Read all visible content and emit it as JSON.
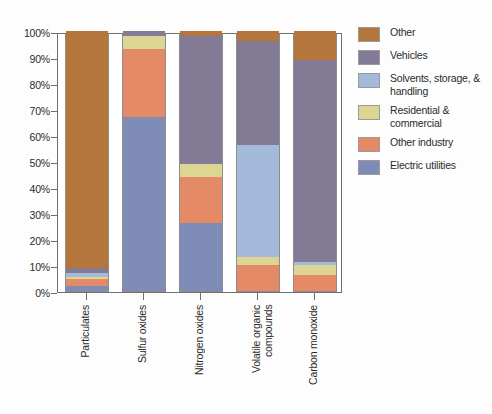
{
  "chart_data": {
    "type": "bar",
    "subtype": "stacked-percentage-column",
    "title": "",
    "subtitle": "",
    "xlabel": "",
    "ylabel": "",
    "ylim": [
      0,
      100
    ],
    "y_tick_labels": [
      "100%",
      "90%",
      "80%",
      "70%",
      "60%",
      "50%",
      "40%",
      "30%",
      "20%",
      "10%",
      "0%"
    ],
    "y_tick_values": [
      100,
      90,
      80,
      70,
      60,
      50,
      40,
      30,
      20,
      10,
      0
    ],
    "grid": false,
    "legend_position": "right",
    "categories": [
      "Particulates",
      "Sulfur oxides",
      "Nitrogen oxides",
      "Volatile organic\ncompounds",
      "Carbon monoxide"
    ],
    "series": [
      {
        "name": "Other",
        "color": "#b4763b",
        "values": [
          91,
          0,
          2,
          4,
          11
        ]
      },
      {
        "name": "Vehicles",
        "color": "#837b95",
        "values": [
          2,
          2,
          49,
          40,
          78
        ]
      },
      {
        "name": "Solvents, storage, & handling",
        "color": "#a3bada",
        "values": [
          1.5,
          0,
          0,
          43,
          1
        ]
      },
      {
        "name": "Residential & commercial",
        "color": "#ddd693",
        "values": [
          1,
          5,
          5,
          3,
          4
        ]
      },
      {
        "name": "Other industry",
        "color": "#e58a66",
        "values": [
          2.5,
          26,
          18,
          10,
          6
        ]
      },
      {
        "name": "Electric utilities",
        "color": "#7f8cb7",
        "values": [
          2,
          67,
          26,
          0,
          0
        ]
      }
    ],
    "stack_order_bottom_to_top": [
      "Electric utilities",
      "Other industry",
      "Residential & commercial",
      "Solvents, storage, & handling",
      "Vehicles",
      "Other"
    ],
    "legend_entries": [
      "Other",
      "Vehicles",
      "Solvents, storage, & handling",
      "Residential & commercial",
      "Other industry",
      "Electric utilities"
    ],
    "axis_color": "#6f6f6f",
    "background_color": "#ffffff"
  }
}
